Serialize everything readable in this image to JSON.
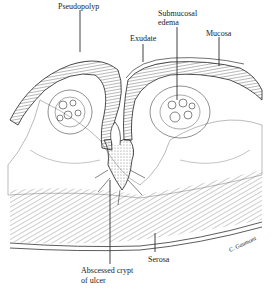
{
  "figure": {
    "type": "histology-illustration"
  },
  "labels": {
    "pseudopolyp": "Pseudopolyp",
    "exudate": "Exudate",
    "submucosal_edema_line1": "Submucosal",
    "submucosal_edema_line2": "edema",
    "mucosa": "Mucosa",
    "serosa": "Serosa",
    "abscessed_crypt_line1": "Abscessed crypt",
    "abscessed_crypt_line2": "of ulcer",
    "signature": "C. Gaumont"
  }
}
